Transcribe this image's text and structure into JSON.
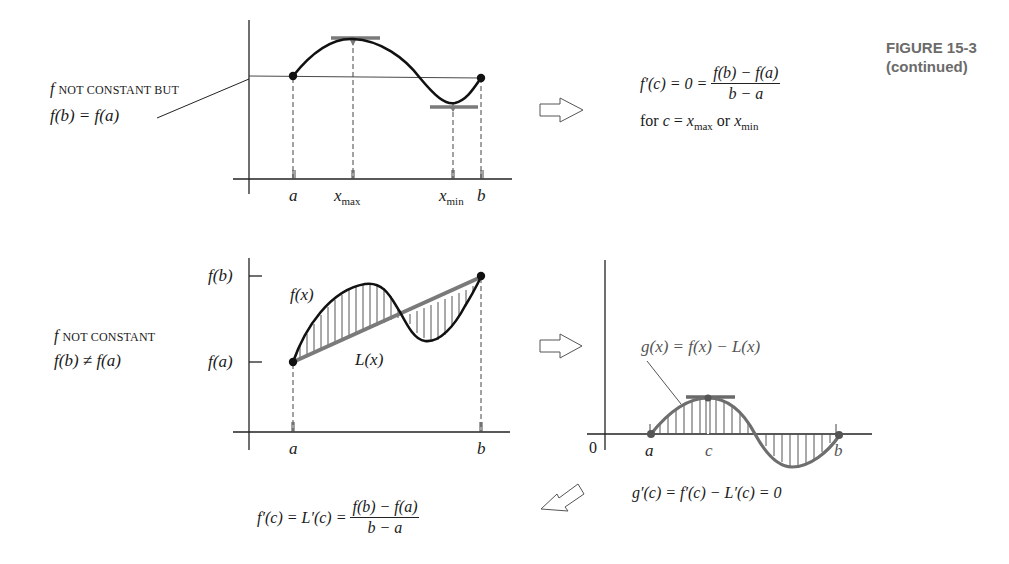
{
  "caption": {
    "figure_number": "FIGURE 15-3",
    "continued": "(continued)"
  },
  "top_panel": {
    "label_line1_f": "f",
    "label_line1_rest": "NOT CONSTANT BUT",
    "label_line2": "f(b) = f(a)",
    "axis_labels": {
      "a": "a",
      "xmax": "x",
      "xmax_sub": "max",
      "xmin": "x",
      "xmin_sub": "min",
      "b": "b"
    },
    "result_lhs": "f′(c) = 0 =",
    "result_num": "f(b) − f(a)",
    "result_den": "b − a",
    "result_note_pre": "for ",
    "result_note_c": "c",
    "result_note_eq": " = ",
    "result_note_x1": "x",
    "result_note_sub1": "max",
    "result_note_or": " or ",
    "result_note_x2": "x",
    "result_note_sub2": "min"
  },
  "bottom_panel": {
    "label_line1_f": "f",
    "label_line1_rest": "NOT CONSTANT",
    "label_line2": "f(b) ≠ f(a)",
    "y_labels": {
      "fb": "f(b)",
      "fa": "f(a)"
    },
    "curve_label": "f(x)",
    "line_label": "L(x)",
    "axis_labels": {
      "a": "a",
      "b": "b"
    }
  },
  "g_panel": {
    "curve_label": "g(x) = f(x) − L(x)",
    "axis_labels": {
      "zero": "0",
      "a": "a",
      "c": "c",
      "b": "b"
    },
    "derivative_eq": "g′(c) = f′(c) − L′(c) = 0"
  },
  "conclusion": {
    "lhs": "f′(c) = L′(c) =",
    "num": "f(b) − f(a)",
    "den": "b − a"
  },
  "colors": {
    "ink": "#1a1a1a",
    "gray_ink": "#6e6e6e",
    "caption_gray": "#6b6b6b"
  }
}
